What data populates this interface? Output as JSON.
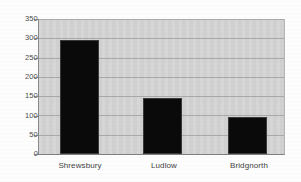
{
  "chart_data": {
    "type": "bar",
    "title": "",
    "subtitle": "",
    "xlabel": "",
    "ylabel": "",
    "categories": [
      "Shrewsbury",
      "Ludlow",
      "Bridgnorth"
    ],
    "values": [
      295,
      145,
      97
    ],
    "series": [
      {
        "name": "",
        "values": [
          295,
          145,
          97
        ]
      }
    ],
    "ylim": [
      0,
      350
    ],
    "yticks": [
      0,
      50,
      100,
      150,
      200,
      250,
      300,
      350
    ],
    "ytick_labels": [
      "0",
      "50",
      "100",
      "150",
      "200",
      "250",
      "300",
      "350"
    ],
    "grid": true,
    "grid_axis": "y",
    "legend": false,
    "legend_position": "none",
    "bar_color": "#0a0a0a",
    "plot_background": "#d2d2d2",
    "figure_background": "#fdfdfd",
    "gridline_color": "#a9a9a9",
    "axis_color": "#8a8a8a",
    "tick_label_color": "#4b4b4b"
  }
}
